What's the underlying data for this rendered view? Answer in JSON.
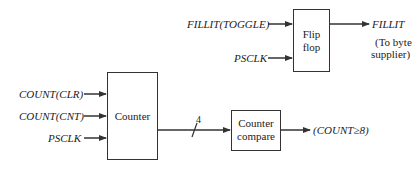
{
  "diagram": {
    "type": "block-diagram",
    "blocks": {
      "flip_flop": {
        "label_line1": "Flip",
        "label_line2": "flop"
      },
      "counter": {
        "label": "Counter"
      },
      "counter_compare": {
        "label_line1": "Counter",
        "label_line2": "compare"
      }
    },
    "signals": {
      "fillit_toggle": "FILLIT(TOGGLE)",
      "psclk_top": "PSCLK",
      "fillit_out": "FILLIT",
      "fillit_note_line1": "(To byte",
      "fillit_note_line2": "supplier)",
      "count_clr": "COUNT(CLR)",
      "count_cnt": "COUNT(CNT)",
      "psclk_bottom": "PSCLK",
      "bus_width": "4",
      "count_ge_8": "(COUNT≥8)"
    },
    "colors": {
      "line": "#333333",
      "text": "#222222",
      "background": "#ffffff"
    }
  }
}
